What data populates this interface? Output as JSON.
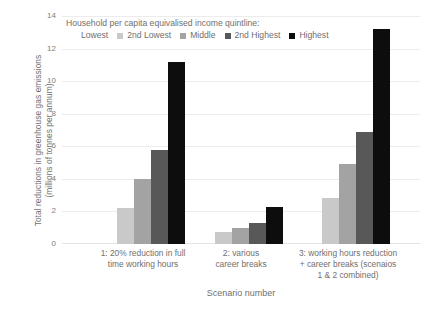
{
  "chart_data": {
    "type": "bar",
    "title": "",
    "xlabel": "Scenario number",
    "ylabel": "Total reductions in greenhouse gas emissions (millions of tonnes per annum)",
    "ylabel_line1": "Total reductions in greenhouse gas emissions",
    "ylabel_line2": "(millions of tonnes per annum)",
    "legend_title": "Household per capita equivalised income quintline:",
    "legend_position": "top-left-inside",
    "grid": true,
    "ylim": [
      0,
      14
    ],
    "yticks": [
      0,
      2,
      4,
      6,
      8,
      10,
      12,
      14
    ],
    "ytick_labels": [
      "0",
      "2",
      "4",
      "6",
      "8",
      "10",
      "12",
      "14"
    ],
    "categories": [
      "1: 20% reduction in full time working hours",
      "2: various career breaks",
      "3: working hours reduction + career breaks (scenaios 1 & 2 combined)"
    ],
    "category_label_lines": [
      [
        "1: 20% reduction in full",
        "time working hours"
      ],
      [
        "2: various",
        "career breaks"
      ],
      [
        "3: working hours reduction",
        "+ career breaks (scenaios",
        "1 & 2 combined)"
      ]
    ],
    "series": [
      {
        "name": "Lowest",
        "color": "#ffffff",
        "values": [
          0,
          0,
          0
        ]
      },
      {
        "name": "2nd Lowest",
        "color": "#c9c9c9",
        "values": [
          2.2,
          0.75,
          2.8
        ]
      },
      {
        "name": "Middle",
        "color": "#a3a3a3",
        "values": [
          4.0,
          1.0,
          4.9
        ]
      },
      {
        "name": "2nd Highest",
        "color": "#585858",
        "values": [
          5.8,
          1.3,
          6.9
        ]
      },
      {
        "name": "Highest",
        "color": "#0d0d0d",
        "values": [
          11.2,
          2.3,
          13.2
        ]
      }
    ]
  },
  "colors": {
    "background": "#ffffff",
    "text": "#6f6f6f",
    "gridline": "#ececec",
    "lowest": "#ffffff",
    "second_lowest": "#c9c9c9",
    "middle": "#a3a3a3",
    "second_highest": "#585858",
    "highest": "#0d0d0d"
  }
}
